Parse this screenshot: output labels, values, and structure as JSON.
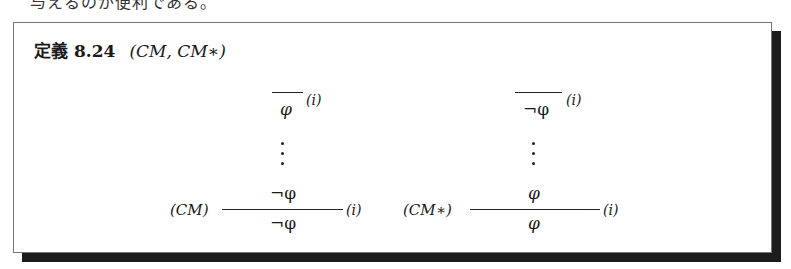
{
  "cut_text": "与えるのが便利である。",
  "definition": {
    "label": "定義",
    "number": "8.24",
    "title": "(CM,  CM∗)"
  },
  "rules": [
    {
      "name": "CM",
      "rule_label": "(CM)",
      "assumption": "φ",
      "assumption_label": "(i)",
      "premise": "¬φ",
      "conclusion": "¬φ",
      "discharge_label": "(i)"
    },
    {
      "name": "CM*",
      "rule_label": "(CM∗)",
      "assumption": "¬φ",
      "assumption_label": "(i)",
      "premise": "φ",
      "conclusion": "φ",
      "discharge_label": "(i)"
    }
  ],
  "vdots": "⋮",
  "colors": {
    "shadow": "#1c1c1c",
    "border": "#777777",
    "text": "#1a1a1a"
  }
}
